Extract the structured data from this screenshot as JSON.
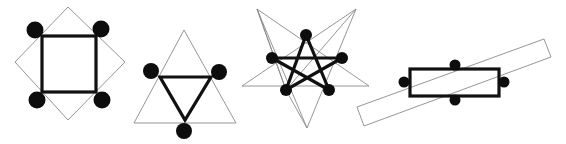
{
  "figure": {
    "colors": {
      "background": "#ffffff",
      "outline": "#8a8a8a",
      "bold": "#111111",
      "dot": "#0d0d0d"
    },
    "panels": [
      {
        "id": "square",
        "outer_shape": "diamond (rotated square)",
        "inner_shape": "square",
        "dot_count": 4
      },
      {
        "id": "triangle",
        "outer_shape": "upright triangle",
        "inner_shape": "inverted triangle",
        "dot_count": 3
      },
      {
        "id": "pentagram",
        "outer_shape": "large five-pointed star",
        "inner_shape": "pentagram",
        "dot_count": 5
      },
      {
        "id": "rectangle",
        "outer_shape": "tilted long rectangle",
        "inner_shape": "horizontal rectangle",
        "dot_count": 4
      }
    ]
  }
}
